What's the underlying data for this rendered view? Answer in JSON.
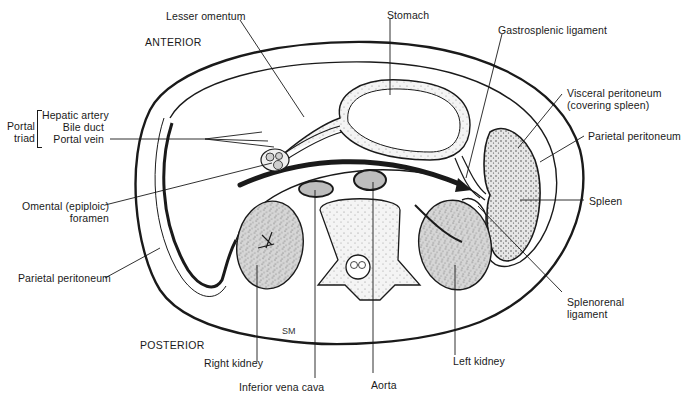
{
  "figure": {
    "signature": "SM"
  },
  "orientation": {
    "anterior": "ANTERIOR",
    "posterior": "POSTERIOR"
  },
  "labels": {
    "lesser_omentum": "Lesser omentum",
    "stomach": "Stomach",
    "gastrosplenic_ligament": "Gastrosplenic ligament",
    "visceral_peritoneum_line1": "Visceral peritoneum",
    "visceral_peritoneum_line2": "(covering spleen)",
    "parietal_peritoneum_right": "Parietal peritoneum",
    "spleen": "Spleen",
    "splenorenal_line1": "Splenorenal",
    "splenorenal_line2": "ligament",
    "left_kidney": "Left kidney",
    "aorta": "Aorta",
    "ivc": "Inferior vena cava",
    "right_kidney": "Right kidney",
    "parietal_peritoneum_left": "Parietal peritoneum",
    "omental_foramen_line1": "Omental (epiploic)",
    "omental_foramen_line2": "foramen",
    "portal_triad_group_line1": "Portal",
    "portal_triad_group_line2": "triad",
    "hepatic_artery": "Hepatic artery",
    "bile_duct": "Bile duct",
    "portal_vein": "Portal vein"
  },
  "colors": {
    "ink": "#1a1a1a",
    "organ_fill": "#d4d4d4",
    "vessel_fill": "#bdbdbd",
    "background": "#ffffff"
  }
}
